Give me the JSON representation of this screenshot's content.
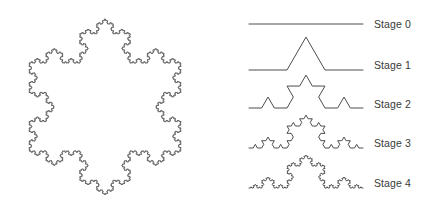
{
  "figure": {
    "background_color": "#ffffff",
    "stroke_color": "#4d4d4d",
    "label_color": "#3a3a3a"
  },
  "snowflake": {
    "name": "Koch snowflake",
    "iterations": 5,
    "bounds": {
      "x": 25,
      "y": 13,
      "width": 160,
      "height": 185
    },
    "center_x": 105,
    "center_y": 107,
    "side_length": 152,
    "rotation_degrees": 0
  },
  "stages": {
    "label_x": 374,
    "curve_left_x": 249,
    "curve_right_x": 363,
    "items": [
      {
        "label": "Stage 0",
        "iterations": 0,
        "baseline_y": 24,
        "label_y": 24
      },
      {
        "label": "Stage 1",
        "iterations": 1,
        "baseline_y": 70,
        "label_y": 65
      },
      {
        "label": "Stage 2",
        "iterations": 2,
        "baseline_y": 108,
        "label_y": 104
      },
      {
        "label": "Stage 3",
        "iterations": 3,
        "baseline_y": 148,
        "label_y": 143
      },
      {
        "label": "Stage 4",
        "iterations": 4,
        "baseline_y": 188,
        "label_y": 183
      }
    ]
  },
  "chart_data": {
    "type": "diagram",
    "categories": [
      "Stage 0",
      "Stage 1",
      "Stage 2",
      "Stage 3",
      "Stage 4"
    ],
    "segment_counts": [
      1,
      4,
      16,
      64,
      256
    ],
    "relative_lengths": [
      1,
      1.3333,
      1.7778,
      2.3704,
      3.1605
    ],
    "scaling_rule": "Each segment is replaced by 4 segments of 1/3 the length",
    "fractal_dimension": 1.2619,
    "legend_position": "right"
  }
}
